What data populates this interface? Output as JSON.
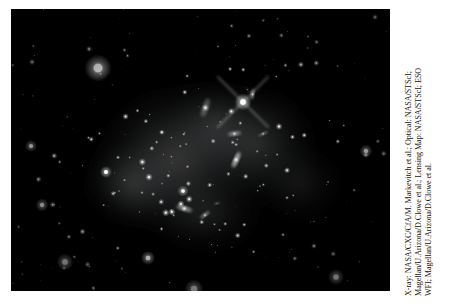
{
  "page": {
    "background_color": "#ffffff",
    "width": 449,
    "height": 307
  },
  "image": {
    "title": "Bullet Cluster 1E 0657-56",
    "alt": "Grayscale astronomical image of the Bullet Cluster galaxy cluster collision, showing a dense starfield with a large diffuse luminous halo at center",
    "background_color": "#000000",
    "frame": {
      "left": 11,
      "top": 9,
      "width": 379,
      "height": 282
    },
    "dominant_colors": {
      "sky": "#000000",
      "stars": "#ffffff",
      "diffuse_halo": "#9aa0a4",
      "faint_nebulosity": "#4d5256"
    }
  },
  "credit": {
    "lines": [
      "X-ray: NASA/CXC/CfA/M. Markevitch et al.; Optical: NASA/STScI;",
      "Magellan/U.Arizona/D.Clowe et al.; Lensing Map: NASA/STScI; ESO",
      "WFI; Magellan/U.Arizona/D.Clowe et al."
    ],
    "orientation": "rotated-90-ccw",
    "text_color": "#141414"
  },
  "chart_data": {
    "type": "scatter",
    "xlabel": "",
    "ylabel": "",
    "xlim": [
      0,
      379
    ],
    "ylim": [
      0,
      282
    ],
    "grid": false,
    "legend": null,
    "annotations": [
      {
        "label": "bright foreground star (saturated, diffraction spikes)",
        "x": 232,
        "y": 93,
        "magnitude": 1.0
      },
      {
        "label": "large fuzzy bright star upper-left",
        "x": 87,
        "y": 59,
        "magnitude": 0.95
      },
      {
        "label": "diffuse lensing-map halo (dark matter clump, west)",
        "x": 150,
        "y": 150,
        "magnitude": 0.45
      },
      {
        "label": "diffuse lensing-map halo (dark matter clump, east)",
        "x": 250,
        "y": 140,
        "magnitude": 0.38
      }
    ],
    "halos": [
      {
        "cx": 165,
        "cy": 150,
        "rx": 95,
        "ry": 88,
        "intensity": 0.42
      },
      {
        "cx": 245,
        "cy": 135,
        "rx": 72,
        "ry": 70,
        "intensity": 0.33
      },
      {
        "cx": 120,
        "cy": 175,
        "rx": 58,
        "ry": 52,
        "intensity": 0.3
      },
      {
        "cx": 205,
        "cy": 115,
        "rx": 60,
        "ry": 55,
        "intensity": 0.26
      },
      {
        "cx": 290,
        "cy": 175,
        "rx": 52,
        "ry": 48,
        "intensity": 0.16
      },
      {
        "cx": 195,
        "cy": 205,
        "rx": 70,
        "ry": 50,
        "intensity": 0.18
      }
    ],
    "bright_stars": [
      {
        "x": 87,
        "y": 59,
        "r": 13.5,
        "i": 1.0
      },
      {
        "x": 232,
        "y": 93,
        "r": 8.5,
        "i": 1.0,
        "spikes": true
      },
      {
        "x": 183,
        "y": 280,
        "r": 9.5,
        "i": 0.95
      },
      {
        "x": 54,
        "y": 253,
        "r": 8.5,
        "i": 0.92
      },
      {
        "x": 137,
        "y": 249,
        "r": 7.0,
        "i": 0.9
      },
      {
        "x": 178,
        "y": 288,
        "r": 6.5,
        "i": 0.85
      },
      {
        "x": 325,
        "y": 268,
        "r": 8.0,
        "i": 0.9
      },
      {
        "x": 31,
        "y": 196,
        "r": 6.5,
        "i": 0.85
      },
      {
        "x": 20,
        "y": 137,
        "r": 6.0,
        "i": 0.8
      },
      {
        "x": 355,
        "y": 142,
        "r": 6.5,
        "i": 0.85
      },
      {
        "x": 95,
        "y": 163,
        "r": 6.0,
        "i": 0.82
      },
      {
        "x": 172,
        "y": 182,
        "r": 5.5,
        "i": 0.8
      }
    ],
    "star_count_estimate": 620
  }
}
